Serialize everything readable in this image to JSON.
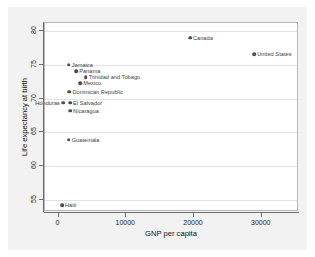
{
  "chart_data": {
    "type": "scatter",
    "title": "",
    "xlabel": "GNP per capita",
    "ylabel": "Life expectancy at birth",
    "xlim": [
      -2000,
      35500
    ],
    "ylim": [
      53.2,
      81.2
    ],
    "xticks": [
      0,
      10000,
      20000,
      30000
    ],
    "xtick_labels": [
      "0",
      "10000",
      "20000",
      "30000"
    ],
    "yticks": [
      55,
      60,
      65,
      70,
      75,
      80
    ],
    "ytick_labels": [
      "55",
      "60",
      "65",
      "70",
      "75",
      "80"
    ],
    "grid": "horizontal",
    "legend": "none",
    "marker_color": "#4d4d4d",
    "points": [
      {
        "label": "Canada",
        "x": 19400,
        "y": 79.0,
        "label_side": "right"
      },
      {
        "label": "United States",
        "x": 28900,
        "y": 76.6,
        "label_side": "right"
      },
      {
        "label": "Jamaica",
        "x": 1500,
        "y": 75.0,
        "label_side": "right"
      },
      {
        "label": "Panama",
        "x": 2600,
        "y": 74.1,
        "label_side": "right"
      },
      {
        "label": "Trinidad and Tobago",
        "x": 4000,
        "y": 73.2,
        "label_side": "right"
      },
      {
        "label": "Mexico",
        "x": 3200,
        "y": 72.3,
        "label_side": "right"
      },
      {
        "label": "Dominican Republic",
        "x": 1600,
        "y": 71.0,
        "label_side": "right"
      },
      {
        "label": "Honduras",
        "x": 650,
        "y": 69.4,
        "label_side": "left"
      },
      {
        "label": "El Salvador",
        "x": 1700,
        "y": 69.4,
        "label_side": "right"
      },
      {
        "label": "Nicaragua",
        "x": 1700,
        "y": 68.2,
        "label_side": "right"
      },
      {
        "label": "Guatemala",
        "x": 1500,
        "y": 63.9,
        "label_side": "right"
      },
      {
        "label": "Haiti",
        "x": 500,
        "y": 54.2,
        "label_side": "right"
      }
    ]
  }
}
